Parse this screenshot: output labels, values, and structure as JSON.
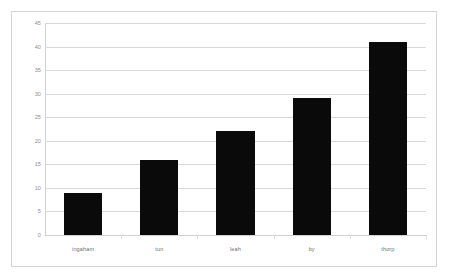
{
  "chart_data": {
    "type": "bar",
    "title": "",
    "subtitle": "",
    "xlabel": "",
    "ylabel": "",
    "categories": [
      "ingaham",
      "tun",
      "leah",
      "by",
      "thorp"
    ],
    "values": [
      9,
      16,
      22,
      29,
      41
    ],
    "series": [
      {
        "name": "",
        "values": [
          9,
          16,
          22,
          29,
          41
        ]
      }
    ],
    "ylim": [
      0,
      45
    ],
    "ytick_interval": 5,
    "yticks": [
      0,
      5,
      10,
      15,
      20,
      25,
      30,
      35,
      40,
      45
    ],
    "ytick_labels": [
      "0",
      "5",
      "10",
      "15",
      "20",
      "25",
      "30",
      "35",
      "40",
      "45"
    ],
    "grid": true,
    "grid_axis": "y",
    "legend": false,
    "legend_position": "none",
    "annotations": [],
    "colors": {
      "bar": "#0a0a0a",
      "gridline": "#d9d9d9",
      "axis": "#d0d0d0",
      "tick_text": "#8c8c8c",
      "category_text": "#6f6f6f",
      "frame_border": "#d5d5d5",
      "background": "#ffffff"
    }
  }
}
